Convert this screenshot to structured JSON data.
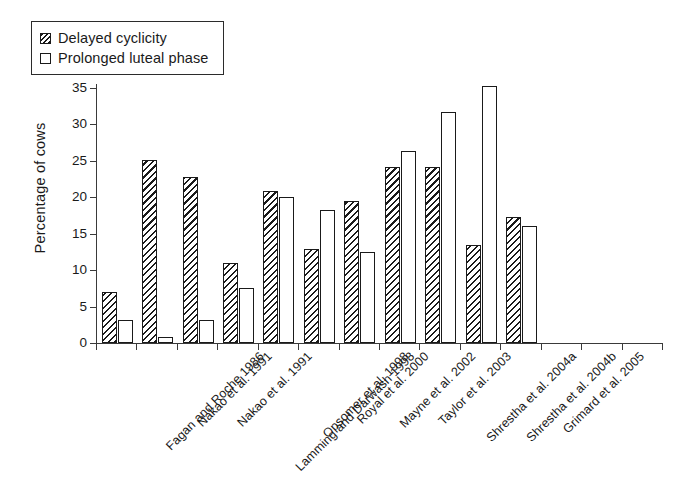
{
  "chart_data": {
    "type": "bar",
    "title": "",
    "xlabel": "",
    "ylabel": "Percentage of cows",
    "ylim": [
      0,
      35
    ],
    "ytick_step": 5,
    "yticks": [
      0,
      5,
      10,
      15,
      20,
      25,
      30,
      35
    ],
    "ytick_labels": [
      "0",
      "5",
      "10",
      "15",
      "20",
      "25",
      "30",
      "35"
    ],
    "grid": false,
    "legend_position": "top-left",
    "categories": [
      "Fagan and Roche 1986",
      "Nakao et al. 1991",
      "Nakao et al. 1991",
      "Lamming and Darwash 1998",
      "Opsomer et al. 1998",
      "Royal et al. 2000",
      "Mayne et al. 2002",
      "Taylor et al. 2003",
      "Shrestha et al. 2004a",
      "Shrestha et al. 2004b",
      "Grimard et al. 2005"
    ],
    "series": [
      {
        "name": "Delayed cyclicity",
        "fill": "hatched",
        "values": [
          7.0,
          25.1,
          22.8,
          11.0,
          20.8,
          12.9,
          19.5,
          24.2,
          24.2,
          13.4,
          17.3
        ]
      },
      {
        "name": "Prolonged luteal phase",
        "fill": "open",
        "values": [
          3.1,
          0.8,
          3.1,
          7.5,
          20.1,
          18.3,
          12.5,
          26.4,
          31.7,
          35.3,
          16.0
        ]
      }
    ],
    "colors": {
      "line": "#1a1a1a",
      "axis": "#3a3a3a",
      "background": "#ffffff"
    }
  },
  "legend": {
    "items": [
      {
        "label": "Delayed cyclicity",
        "swatch": "hatched-square-icon"
      },
      {
        "label": "Prolonged luteal phase",
        "swatch": "open-square-icon"
      }
    ]
  }
}
